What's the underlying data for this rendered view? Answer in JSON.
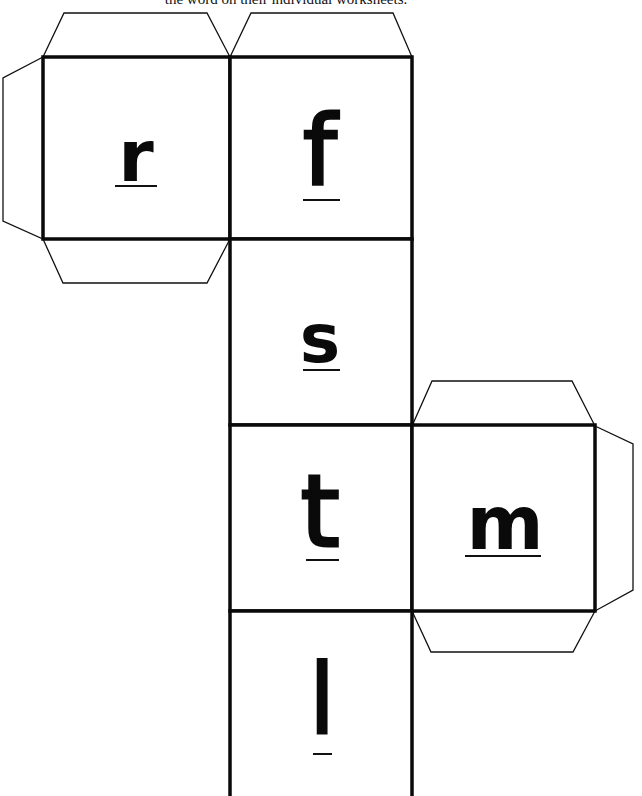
{
  "document": {
    "caption": "the word on their individual worksheets."
  },
  "cube_net": {
    "faces": [
      {
        "id": "face-r",
        "letter": "r"
      },
      {
        "id": "face-f",
        "letter": "f"
      },
      {
        "id": "face-s",
        "letter": "s"
      },
      {
        "id": "face-t",
        "letter": "t"
      },
      {
        "id": "face-m",
        "letter": "m"
      },
      {
        "id": "face-l",
        "letter": "l"
      }
    ]
  },
  "colors": {
    "line": "#0a0a0a",
    "background": "#ffffff"
  }
}
